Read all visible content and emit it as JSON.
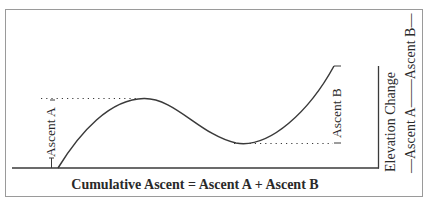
{
  "diagram": {
    "title": "",
    "bottom_label": "Cumulative Ascent = Ascent A + Ascent B",
    "ascent_a_label": "Ascent A",
    "ascent_b_label": "Ascent B",
    "right_axis_label": "Elevation Change",
    "right_axis_sublabel": "—Ascent A——Ascent B—",
    "colors": {
      "line": "#3a3a3a",
      "frame": "#9a9a9a",
      "text": "#2a2a2a"
    },
    "elements": [
      {
        "type": "curve",
        "description": "elevation profile: rises from baseline to a peak, descends to a valley, then rises to a higher end point"
      },
      {
        "type": "dotted-line",
        "description": "horizontal reference at peak height (Ascent A)"
      },
      {
        "type": "dotted-line",
        "description": "horizontal reference at valley height (Ascent B)"
      },
      {
        "type": "baseline",
        "description": "horizontal ground line"
      },
      {
        "type": "vertical-axis",
        "description": "right vertical line indicating total elevation change"
      }
    ]
  }
}
